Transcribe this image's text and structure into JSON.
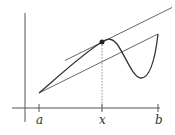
{
  "diagram": {
    "labels": {
      "a": "a",
      "x": "x",
      "b": "b"
    },
    "colors": {
      "line": "#555555",
      "curve": "#333333",
      "point": "#222222",
      "guide": "#777777"
    }
  }
}
